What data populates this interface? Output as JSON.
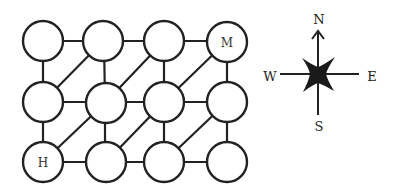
{
  "grid": {
    "rows": 3,
    "cols": 4,
    "node_radius": 20,
    "nodes": [
      {
        "id": "r1c1",
        "row": 1,
        "col": 1,
        "label": ""
      },
      {
        "id": "r1c2",
        "row": 1,
        "col": 2,
        "label": ""
      },
      {
        "id": "r1c3",
        "row": 1,
        "col": 3,
        "label": ""
      },
      {
        "id": "r1c4",
        "row": 1,
        "col": 4,
        "label": "M"
      },
      {
        "id": "r2c1",
        "row": 2,
        "col": 1,
        "label": ""
      },
      {
        "id": "r2c2",
        "row": 2,
        "col": 2,
        "label": ""
      },
      {
        "id": "r2c3",
        "row": 2,
        "col": 3,
        "label": ""
      },
      {
        "id": "r2c4",
        "row": 2,
        "col": 4,
        "label": ""
      },
      {
        "id": "r3c1",
        "row": 3,
        "col": 1,
        "label": "H"
      },
      {
        "id": "r3c2",
        "row": 3,
        "col": 2,
        "label": ""
      },
      {
        "id": "r3c3",
        "row": 3,
        "col": 3,
        "label": ""
      },
      {
        "id": "r3c4",
        "row": 3,
        "col": 4,
        "label": ""
      }
    ],
    "edges": {
      "horizontal": [
        [
          "r1c1",
          "r1c2"
        ],
        [
          "r1c2",
          "r1c3"
        ],
        [
          "r1c3",
          "r1c4"
        ],
        [
          "r2c1",
          "r2c2"
        ],
        [
          "r2c2",
          "r2c3"
        ],
        [
          "r2c3",
          "r2c4"
        ],
        [
          "r3c1",
          "r3c2"
        ],
        [
          "r3c2",
          "r3c3"
        ],
        [
          "r3c3",
          "r3c4"
        ]
      ],
      "vertical": [
        [
          "r1c1",
          "r2c1"
        ],
        [
          "r1c2",
          "r2c2"
        ],
        [
          "r1c3",
          "r2c3"
        ],
        [
          "r1c4",
          "r2c4"
        ],
        [
          "r2c1",
          "r3c1"
        ],
        [
          "r2c2",
          "r3c2"
        ],
        [
          "r2c3",
          "r3c3"
        ],
        [
          "r2c4",
          "r3c4"
        ]
      ],
      "diagonal": [
        [
          "r1c2",
          "r2c1"
        ],
        [
          "r1c3",
          "r2c2"
        ],
        [
          "r1c4",
          "r2c3"
        ],
        [
          "r2c2",
          "r3c1"
        ],
        [
          "r2c3",
          "r3c2"
        ],
        [
          "r2c4",
          "r3c3"
        ]
      ]
    },
    "labels": {
      "start": "H",
      "end": "M"
    }
  },
  "compass": {
    "north": "N",
    "south": "S",
    "east": "E",
    "west": "W"
  }
}
